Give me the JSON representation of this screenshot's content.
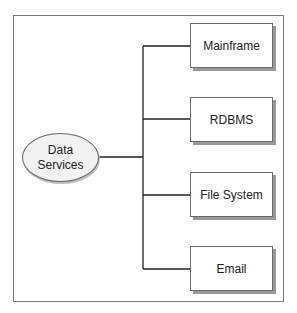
{
  "diagram": {
    "source": {
      "label_line1": "Data",
      "label_line2": "Services"
    },
    "targets": [
      {
        "label": "Mainframe"
      },
      {
        "label": "RDBMS"
      },
      {
        "label": "File System"
      },
      {
        "label": "Email"
      }
    ],
    "colors": {
      "line": "#222222",
      "border": "#6a6a6a",
      "shadow": "#9a9a9a",
      "ellipse_fill": "#f2f2f2"
    }
  }
}
